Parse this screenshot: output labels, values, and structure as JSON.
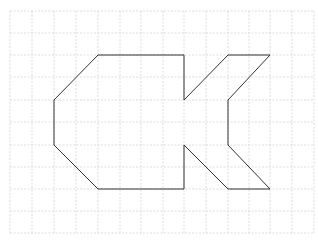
{
  "diagram": {
    "type": "grid-polygon",
    "grid": {
      "x_lines": [
        10,
        32,
        54,
        76,
        98,
        120,
        141,
        163,
        184,
        206,
        228,
        249,
        270,
        292,
        314
      ],
      "y_lines": [
        11,
        33,
        55,
        77,
        100,
        122,
        145,
        167,
        189,
        211,
        233
      ],
      "color": "#d4d4d4",
      "dashed": true
    },
    "shape": {
      "stroke": "#333333",
      "points": "98,55 184,55 184,100 228,55 270,55 228,100 228,145 270,189 228,189 184,145 184,189 98,189 54,145 54,100"
    }
  }
}
